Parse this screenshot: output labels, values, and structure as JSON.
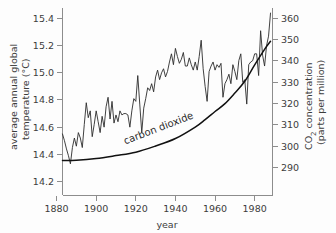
{
  "chart_data": {
    "type": "line",
    "title": "",
    "xlabel": "year",
    "grid": false,
    "legend_position": "inline-annotation",
    "xlim": [
      1883,
      1989
    ],
    "x_ticks": [
      1880,
      1900,
      1920,
      1940,
      1960,
      1980
    ],
    "axes": {
      "left": {
        "label_line1": "average annual global",
        "label_line2": "temperature (°C)",
        "ticks": [
          "15.4",
          "15.2",
          "15.0",
          "14.8",
          "14.6",
          "14.4",
          "14.2"
        ],
        "tick_values": [
          15.4,
          15.2,
          15.0,
          14.8,
          14.6,
          14.4,
          14.2
        ],
        "ylim": [
          14.1,
          15.5
        ],
        "unit": "°C"
      },
      "right": {
        "label_line1": "CO₂ concentration",
        "label_line2": "(parts per million)",
        "ticks": [
          "360",
          "350",
          "340",
          "330",
          "320",
          "310",
          "300",
          "290"
        ],
        "tick_values": [
          360,
          350,
          340,
          330,
          320,
          310,
          300,
          290
        ],
        "ylim": [
          285,
          367
        ],
        "unit": "ppm"
      }
    },
    "annotations": [
      {
        "text": "carbon dioxide",
        "x": 1932,
        "y_ppm": 307,
        "rotation": -21
      }
    ],
    "series": [
      {
        "name": "average annual global temperature",
        "axis": "left",
        "unit": "°C",
        "x": [
          1883,
          1884,
          1885,
          1886,
          1887,
          1888,
          1889,
          1890,
          1891,
          1892,
          1893,
          1894,
          1895,
          1896,
          1897,
          1898,
          1899,
          1900,
          1901,
          1902,
          1903,
          1904,
          1905,
          1906,
          1907,
          1908,
          1909,
          1910,
          1911,
          1912,
          1913,
          1914,
          1915,
          1916,
          1917,
          1918,
          1919,
          1920,
          1921,
          1922,
          1923,
          1924,
          1925,
          1926,
          1927,
          1928,
          1929,
          1930,
          1931,
          1932,
          1933,
          1934,
          1935,
          1936,
          1937,
          1938,
          1939,
          1940,
          1941,
          1942,
          1943,
          1944,
          1945,
          1946,
          1947,
          1948,
          1949,
          1950,
          1951,
          1952,
          1953,
          1954,
          1955,
          1956,
          1957,
          1958,
          1959,
          1960,
          1961,
          1962,
          1963,
          1964,
          1965,
          1966,
          1967,
          1968,
          1969,
          1970,
          1971,
          1972,
          1973,
          1974,
          1975,
          1976,
          1977,
          1978,
          1979,
          1980,
          1981,
          1982,
          1983,
          1984,
          1985,
          1986,
          1987,
          1988
        ],
        "values": [
          14.55,
          14.5,
          14.44,
          14.39,
          14.33,
          14.45,
          14.52,
          14.46,
          14.56,
          14.52,
          14.45,
          14.62,
          14.78,
          14.67,
          14.72,
          14.53,
          14.62,
          14.72,
          14.64,
          14.56,
          14.68,
          14.6,
          14.75,
          14.82,
          14.66,
          14.79,
          14.63,
          14.69,
          14.64,
          14.72,
          14.69,
          14.7,
          14.7,
          14.69,
          14.6,
          14.72,
          14.81,
          14.79,
          14.98,
          14.77,
          14.56,
          14.74,
          14.81,
          14.89,
          14.87,
          14.92,
          14.86,
          14.97,
          15.02,
          14.95,
          15.0,
          15.03,
          14.97,
          15.01,
          15.08,
          15.14,
          15.06,
          15.18,
          15.12,
          15.07,
          15.1,
          15.15,
          15.05,
          15.05,
          15.11,
          15.06,
          15.02,
          15.08,
          15.02,
          15.12,
          15.24,
          15.03,
          14.9,
          14.79,
          15.01,
          15.05,
          15.08,
          15.02,
          15.06,
          15.04,
          15.07,
          14.82,
          14.92,
          14.95,
          14.99,
          14.92,
          15.06,
          15.01,
          14.95,
          15.09,
          15.14,
          14.93,
          14.95,
          14.77,
          15.06,
          15.08,
          15.09,
          15.14,
          15.14,
          14.98,
          15.31,
          15.13,
          15.05,
          15.2,
          15.27,
          15.44
        ]
      },
      {
        "name": "carbon dioxide",
        "axis": "right",
        "unit": "ppm",
        "x": [
          1883,
          1890,
          1900,
          1910,
          1920,
          1930,
          1940,
          1950,
          1955,
          1960,
          1965,
          1970,
          1975,
          1980,
          1985,
          1988
        ],
        "values": [
          293.3,
          293.4,
          294.2,
          295.6,
          297.2,
          300.1,
          303.6,
          309.0,
          312.5,
          316.3,
          320.0,
          325.0,
          330.5,
          338.2,
          345.5,
          349.3
        ]
      }
    ]
  }
}
